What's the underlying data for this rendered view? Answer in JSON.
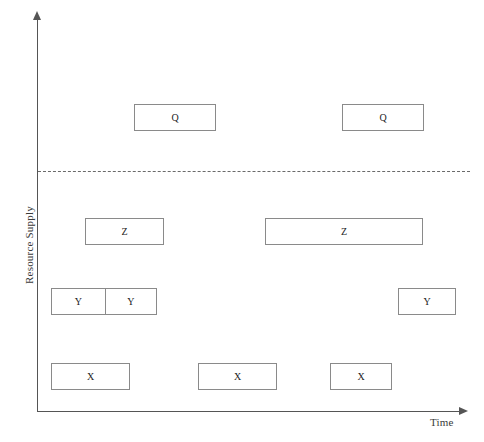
{
  "figure": {
    "axes": {
      "y_label": "Resource Supply",
      "x_label": "Time"
    },
    "threshold": {
      "name": "supply-capacity-line",
      "style": "dashed"
    },
    "boxes": [
      {
        "label": "Q",
        "x": 134,
        "y": 104,
        "w": 82,
        "h": 27
      },
      {
        "label": "Q",
        "x": 342,
        "y": 104,
        "w": 82,
        "h": 27
      },
      {
        "label": "Z",
        "x": 85,
        "y": 218,
        "w": 79,
        "h": 27
      },
      {
        "label": "Z",
        "x": 265,
        "y": 218,
        "w": 158,
        "h": 27
      },
      {
        "label": "Y",
        "x": 398,
        "y": 288,
        "w": 58,
        "h": 27
      },
      {
        "label": "X",
        "x": 51,
        "y": 363,
        "w": 79,
        "h": 27
      },
      {
        "label": "X",
        "x": 198,
        "y": 363,
        "w": 79,
        "h": 27
      },
      {
        "label": "X",
        "x": 330,
        "y": 363,
        "w": 62,
        "h": 27
      }
    ],
    "split_box": {
      "x": 51,
      "y": 288,
      "w": 106,
      "h": 27,
      "cells": [
        {
          "label": "Y",
          "w": 54
        },
        {
          "label": "Y",
          "w": 52
        }
      ]
    }
  },
  "chart_data": {
    "type": "bar",
    "title": "",
    "xlabel": "Time",
    "ylabel": "Resource Supply",
    "grid": false,
    "legend": null,
    "annotations": [
      {
        "name": "capacity-threshold",
        "type": "horizontal-dashed-line",
        "y_value": 172
      }
    ],
    "series": [
      {
        "name": "X",
        "level": 1,
        "blocks": [
          {
            "label": "X",
            "start": 51,
            "end": 130
          },
          {
            "label": "X",
            "start": 198,
            "end": 277
          },
          {
            "label": "X",
            "start": 330,
            "end": 392
          }
        ]
      },
      {
        "name": "Y",
        "level": 2,
        "blocks": [
          {
            "label": "Y",
            "start": 51,
            "end": 105
          },
          {
            "label": "Y",
            "start": 105,
            "end": 157
          },
          {
            "label": "Y",
            "start": 398,
            "end": 456
          }
        ]
      },
      {
        "name": "Z",
        "level": 3,
        "blocks": [
          {
            "label": "Z",
            "start": 85,
            "end": 164
          },
          {
            "label": "Z",
            "start": 265,
            "end": 423
          }
        ]
      },
      {
        "name": "Q",
        "level": 4,
        "blocks": [
          {
            "label": "Q",
            "start": 134,
            "end": 216
          },
          {
            "label": "Q",
            "start": 342,
            "end": 424
          }
        ]
      }
    ]
  },
  "colors": {
    "box_border": "#8a8a8a",
    "axis": "#555555",
    "threshold": "#6a6a6a",
    "text": "#222222",
    "background": "#ffffff"
  }
}
